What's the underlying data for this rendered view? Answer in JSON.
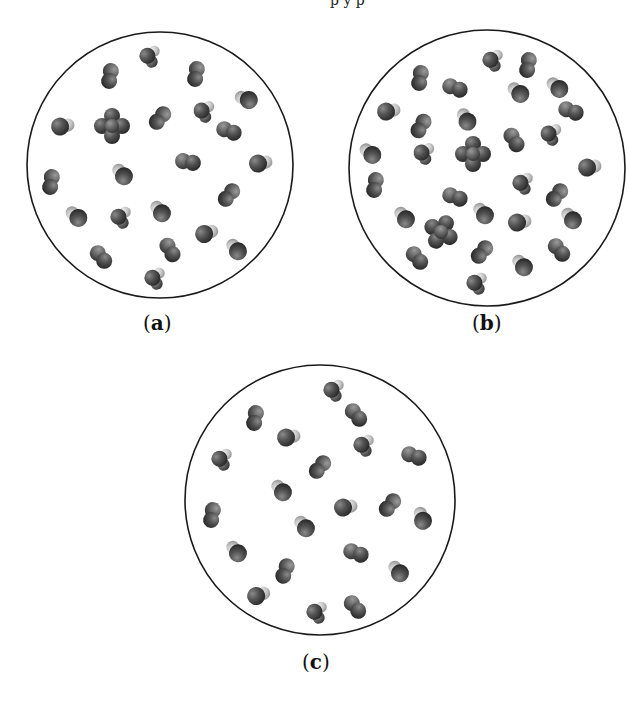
{
  "figure": {
    "top_text_fragment": "p y p",
    "panels": [
      {
        "id": "a",
        "label": "a",
        "circle": {
          "cx": 160,
          "cy": 165,
          "r": 133
        },
        "molecules": [
          {
            "type": "hetero3",
            "x": 150,
            "y": 57,
            "rot": -20
          },
          {
            "type": "diatomic",
            "x": 110,
            "y": 76,
            "rot": 100
          },
          {
            "type": "diatomic",
            "x": 196,
            "y": 74,
            "rot": 100
          },
          {
            "type": "hetero",
            "x": 246,
            "y": 99,
            "rot": 200
          },
          {
            "type": "hetero",
            "x": 63,
            "y": 126,
            "rot": -10
          },
          {
            "type": "tetra",
            "x": 112,
            "y": 126,
            "rot": 0
          },
          {
            "type": "diatomic",
            "x": 160,
            "y": 118,
            "rot": 130
          },
          {
            "type": "hetero3",
            "x": 204,
            "y": 112,
            "rot": -15
          },
          {
            "type": "diatomic",
            "x": 229,
            "y": 131,
            "rot": 20
          },
          {
            "type": "diatomic",
            "x": 188,
            "y": 162,
            "rot": 10
          },
          {
            "type": "hetero",
            "x": 261,
            "y": 163,
            "rot": -10
          },
          {
            "type": "hetero",
            "x": 122,
            "y": 174,
            "rot": 230
          },
          {
            "type": "diatomic",
            "x": 51,
            "y": 182,
            "rot": 100
          },
          {
            "type": "diatomic",
            "x": 229,
            "y": 195,
            "rot": 130
          },
          {
            "type": "hetero",
            "x": 76,
            "y": 216,
            "rot": 220
          },
          {
            "type": "hetero3",
            "x": 121,
            "y": 218,
            "rot": -20
          },
          {
            "type": "hetero",
            "x": 160,
            "y": 211,
            "rot": 230
          },
          {
            "type": "hetero",
            "x": 207,
            "y": 233,
            "rot": -20
          },
          {
            "type": "diatomic",
            "x": 170,
            "y": 250,
            "rot": 60
          },
          {
            "type": "hetero",
            "x": 236,
            "y": 249,
            "rot": 230
          },
          {
            "type": "diatomic",
            "x": 101,
            "y": 257,
            "rot": 50
          },
          {
            "type": "hetero3",
            "x": 155,
            "y": 279,
            "rot": -20
          }
        ]
      },
      {
        "id": "b",
        "label": "b",
        "circle": {
          "cx": 487,
          "cy": 168,
          "r": 138
        },
        "molecules": [
          {
            "type": "hetero3",
            "x": 493,
            "y": 61,
            "rot": -20
          },
          {
            "type": "diatomic",
            "x": 528,
            "y": 65,
            "rot": 100
          },
          {
            "type": "diatomic",
            "x": 420,
            "y": 78,
            "rot": 100
          },
          {
            "type": "diatomic",
            "x": 455,
            "y": 88,
            "rot": 20
          },
          {
            "type": "hetero",
            "x": 518,
            "y": 92,
            "rot": 220
          },
          {
            "type": "hetero",
            "x": 557,
            "y": 87,
            "rot": 220
          },
          {
            "type": "hetero",
            "x": 389,
            "y": 111,
            "rot": -10
          },
          {
            "type": "diatomic",
            "x": 571,
            "y": 111,
            "rot": 20
          },
          {
            "type": "hetero",
            "x": 466,
            "y": 119,
            "rot": 240
          },
          {
            "type": "diatomic",
            "x": 421,
            "y": 126,
            "rot": 120
          },
          {
            "type": "diatomic",
            "x": 514,
            "y": 140,
            "rot": 60
          },
          {
            "type": "hetero3",
            "x": 551,
            "y": 135,
            "rot": -15
          },
          {
            "type": "hetero",
            "x": 370,
            "y": 153,
            "rot": 220
          },
          {
            "type": "hetero3",
            "x": 424,
            "y": 154,
            "rot": -15
          },
          {
            "type": "tetra",
            "x": 473,
            "y": 154,
            "rot": 0
          },
          {
            "type": "hetero",
            "x": 590,
            "y": 167,
            "rot": -10
          },
          {
            "type": "diatomic",
            "x": 375,
            "y": 185,
            "rot": 100
          },
          {
            "type": "hetero3",
            "x": 523,
            "y": 184,
            "rot": -20
          },
          {
            "type": "diatomic",
            "x": 557,
            "y": 195,
            "rot": 130
          },
          {
            "type": "diatomic",
            "x": 455,
            "y": 197,
            "rot": 20
          },
          {
            "type": "hetero",
            "x": 404,
            "y": 217,
            "rot": 230
          },
          {
            "type": "tetra",
            "x": 441,
            "y": 232,
            "rot": 30
          },
          {
            "type": "hetero",
            "x": 483,
            "y": 213,
            "rot": 230
          },
          {
            "type": "hetero",
            "x": 520,
            "y": 222,
            "rot": -10
          },
          {
            "type": "hetero",
            "x": 571,
            "y": 218,
            "rot": 230
          },
          {
            "type": "diatomic",
            "x": 417,
            "y": 258,
            "rot": 50
          },
          {
            "type": "diatomic",
            "x": 482,
            "y": 252,
            "rot": 130
          },
          {
            "type": "diatomic",
            "x": 559,
            "y": 250,
            "rot": 50
          },
          {
            "type": "hetero",
            "x": 522,
            "y": 265,
            "rot": 230
          },
          {
            "type": "hetero3",
            "x": 477,
            "y": 284,
            "rot": -20
          }
        ]
      },
      {
        "id": "c",
        "label": "c",
        "circle": {
          "cx": 320,
          "cy": 500,
          "r": 135
        },
        "molecules": [
          {
            "type": "hetero3",
            "x": 334,
            "y": 391,
            "rot": -20
          },
          {
            "type": "diatomic",
            "x": 255,
            "y": 418,
            "rot": 100
          },
          {
            "type": "diatomic",
            "x": 356,
            "y": 415,
            "rot": 50
          },
          {
            "type": "hetero",
            "x": 289,
            "y": 437,
            "rot": -10
          },
          {
            "type": "hetero3",
            "x": 364,
            "y": 446,
            "rot": -20
          },
          {
            "type": "hetero3",
            "x": 222,
            "y": 460,
            "rot": -20
          },
          {
            "type": "diatomic",
            "x": 414,
            "y": 456,
            "rot": 20
          },
          {
            "type": "diatomic",
            "x": 320,
            "y": 467,
            "rot": 130
          },
          {
            "type": "hetero",
            "x": 281,
            "y": 490,
            "rot": 230
          },
          {
            "type": "hetero",
            "x": 346,
            "y": 507,
            "rot": -10
          },
          {
            "type": "diatomic",
            "x": 390,
            "y": 505,
            "rot": 130
          },
          {
            "type": "hetero",
            "x": 422,
            "y": 518,
            "rot": 250
          },
          {
            "type": "diatomic",
            "x": 212,
            "y": 515,
            "rot": 100
          },
          {
            "type": "hetero",
            "x": 304,
            "y": 526,
            "rot": 230
          },
          {
            "type": "diatomic",
            "x": 356,
            "y": 553,
            "rot": 20
          },
          {
            "type": "hetero",
            "x": 236,
            "y": 551,
            "rot": 230
          },
          {
            "type": "diatomic",
            "x": 285,
            "y": 571,
            "rot": 110
          },
          {
            "type": "hetero",
            "x": 398,
            "y": 571,
            "rot": 230
          },
          {
            "type": "hetero",
            "x": 259,
            "y": 595,
            "rot": -20
          },
          {
            "type": "diatomic",
            "x": 355,
            "y": 607,
            "rot": 50
          },
          {
            "type": "hetero3",
            "x": 317,
            "y": 613,
            "rot": -20
          }
        ]
      }
    ]
  },
  "colors": {
    "outline": "#1a1a1a",
    "atom_dark": "#3a3a3a",
    "atom_mid": "#5a5a5a",
    "atom_light": "#c8c8c8",
    "background": "#ffffff"
  },
  "captions": {
    "a": "a",
    "b": "b",
    "c": "c"
  }
}
